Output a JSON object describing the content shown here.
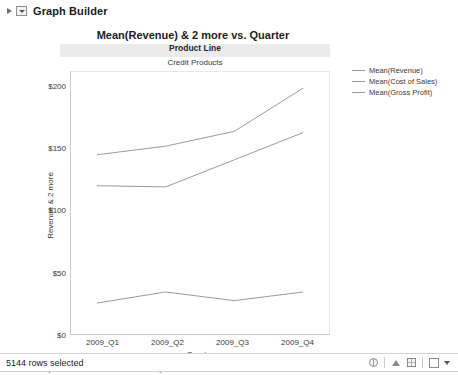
{
  "window": {
    "outline_title": "Graph Builder",
    "disclosure_icon": "triangle-right-icon",
    "combo_icon": "dropdown-box-icon"
  },
  "chart": {
    "title": "Mean(Revenue) & 2 more vs. Quarter",
    "group_header": "Product Line",
    "group_value": "Credit Products"
  },
  "legend": {
    "items": [
      {
        "label": "Mean(Revenue)",
        "color": "#9a9a9a"
      },
      {
        "label": "Mean(Cost of Sales)",
        "color": "#9a9a9a"
      },
      {
        "label": "Mean(Gross Profit)",
        "color": "#9a9a9a"
      }
    ]
  },
  "footer": {
    "where_clause": "Where(Product Line = Credit Products)",
    "status_text": "5144 rows selected",
    "icons": [
      "globe-icon",
      "up-arrow-icon",
      "grid-icon",
      "checkbox-icon",
      "caret-down-icon"
    ]
  },
  "chart_data": {
    "type": "line",
    "title": "Mean(Revenue) & 2 more vs. Quarter",
    "subtitle": "Credit Products",
    "xlabel": "Quarter",
    "ylabel": "Revenue & 2 more",
    "categories": [
      "2009_Q1",
      "2009_Q2",
      "2009_Q3",
      "2009_Q4"
    ],
    "x_tick_labels": [
      "2009_Q1",
      "2009_Q2",
      "2009_Q3",
      "2009_Q4"
    ],
    "y_tick_labels": [
      "$0",
      "$50",
      "$100",
      "$150",
      "$200"
    ],
    "y_ticks": [
      0,
      50,
      100,
      150,
      200
    ],
    "ylim": [
      0,
      212
    ],
    "grid": false,
    "legend_position": "right",
    "series": [
      {
        "name": "Mean(Revenue)",
        "color": "#9a9a9a",
        "values": [
          145,
          152,
          164,
          199
        ]
      },
      {
        "name": "Mean(Cost of Sales)",
        "color": "#9a9a9a",
        "values": [
          120,
          119,
          141,
          163
        ]
      },
      {
        "name": "Mean(Gross Profit)",
        "color": "#9a9a9a",
        "values": [
          25,
          34,
          27,
          34
        ]
      }
    ]
  }
}
